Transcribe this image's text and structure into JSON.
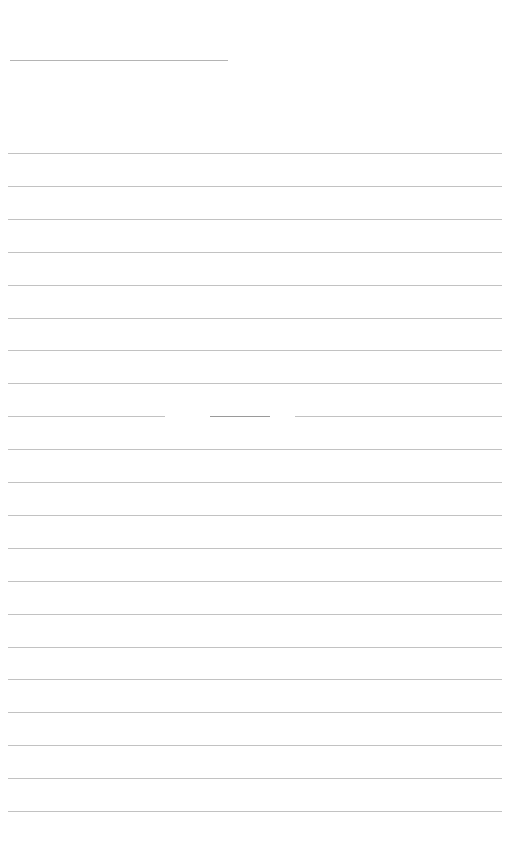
{
  "document": {
    "type": "lined-paper",
    "background_color": "#ffffff",
    "rule_color": "#c2c2c2",
    "header_line": {
      "x": 10,
      "y": 60,
      "width": 218
    },
    "rules": {
      "count": 21,
      "first_y": 153,
      "spacing": 32.9,
      "x": 8,
      "width": 494
    },
    "broken_rule": {
      "index": 8,
      "segments": [
        {
          "x": 8,
          "width": 157
        },
        {
          "x": 210,
          "width": 60
        },
        {
          "x": 295,
          "width": 207
        }
      ]
    }
  }
}
